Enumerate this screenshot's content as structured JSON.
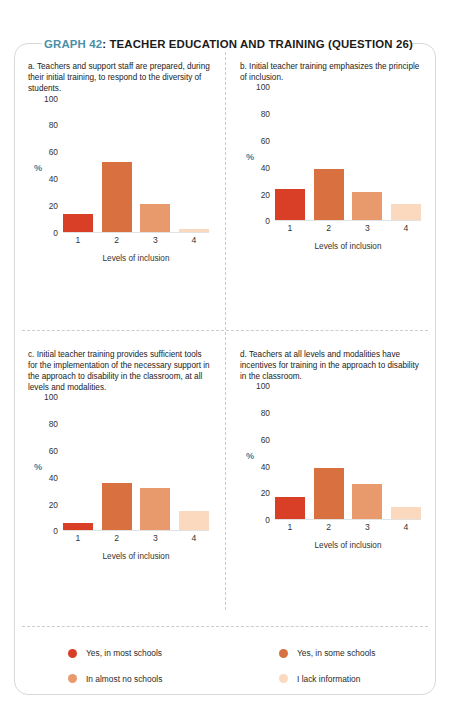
{
  "title": {
    "graph_number": "GRAPH 42",
    "separator": ": ",
    "text": "TEACHER EDUCATION AND TRAINING (QUESTION 26)",
    "accent_color": "#4a8fa8"
  },
  "axis": {
    "ylabel": "%",
    "xlabel": "Levels of inclusion",
    "yticks": [
      "0",
      "20",
      "40",
      "60",
      "80",
      "100"
    ],
    "xticks": [
      "1",
      "2",
      "3",
      "4"
    ],
    "ylim": [
      0,
      100
    ]
  },
  "colors": {
    "level1": "#d93f27",
    "level2": "#d9703f",
    "level3": "#e89a6d",
    "level4": "#fad9be",
    "divider": "#cccccc",
    "card_border": "#d8d8d8"
  },
  "legend": {
    "items": [
      {
        "label": "Yes, in most schools",
        "color": "#d93f27"
      },
      {
        "label": "Yes, in some schools",
        "color": "#d9703f"
      },
      {
        "label": "In almost no schools",
        "color": "#e89a6d"
      },
      {
        "label": "I lack information",
        "color": "#fad9be"
      }
    ]
  },
  "panels": [
    {
      "id": "a",
      "caption": "a. Teachers and support staff are prepared, during their initial training, to respond to the diversity of students."
    },
    {
      "id": "b",
      "caption": "b. Initial teacher training emphasizes the principle of inclusion."
    },
    {
      "id": "c",
      "caption": "c. Initial teacher training provides sufficient tools for the implementation of the necessary support in the approach to disability in the classroom, at all levels and modalities."
    },
    {
      "id": "d",
      "caption": "d. Teachers at all levels and modalities have incentives for training in the approach to disability in the classroom."
    }
  ],
  "chart_data": [
    {
      "type": "bar",
      "panel": "a",
      "title": "a. Teachers and support staff are prepared, during their initial training, to respond to the diversity of students.",
      "categories": [
        "1",
        "2",
        "3",
        "4"
      ],
      "values": [
        14,
        53,
        21,
        3
      ],
      "colors": [
        "#d93f27",
        "#d9703f",
        "#e89a6d",
        "#fad9be"
      ],
      "xlabel": "Levels of inclusion",
      "ylabel": "%",
      "ylim": [
        0,
        100
      ],
      "yticks": [
        0,
        20,
        40,
        60,
        80,
        100
      ],
      "grid": false,
      "legend_position": "bottom"
    },
    {
      "type": "bar",
      "panel": "b",
      "title": "b. Initial teacher training emphasizes the principle of inclusion.",
      "categories": [
        "1",
        "2",
        "3",
        "4"
      ],
      "values": [
        24,
        39,
        22,
        13
      ],
      "colors": [
        "#d93f27",
        "#d9703f",
        "#e89a6d",
        "#fad9be"
      ],
      "xlabel": "Levels of inclusion",
      "ylabel": "%",
      "ylim": [
        0,
        100
      ],
      "yticks": [
        0,
        20,
        40,
        60,
        80,
        100
      ],
      "grid": false,
      "legend_position": "bottom"
    },
    {
      "type": "bar",
      "panel": "c",
      "title": "c. Initial teacher training provides sufficient tools for the implementation of the necessary support in the approach to disability in the classroom, at all levels and modalities.",
      "categories": [
        "1",
        "2",
        "3",
        "4"
      ],
      "values": [
        6,
        36,
        32,
        15
      ],
      "colors": [
        "#d93f27",
        "#d9703f",
        "#e89a6d",
        "#fad9be"
      ],
      "xlabel": "Levels of inclusion",
      "ylabel": "%",
      "ylim": [
        0,
        100
      ],
      "yticks": [
        0,
        20,
        40,
        60,
        80,
        100
      ],
      "grid": false,
      "legend_position": "bottom"
    },
    {
      "type": "bar",
      "panel": "d",
      "title": "d. Teachers at all levels and modalities have incentives for training in the approach to disability in the classroom.",
      "categories": [
        "1",
        "2",
        "3",
        "4"
      ],
      "values": [
        17,
        39,
        27,
        10
      ],
      "colors": [
        "#d93f27",
        "#d9703f",
        "#e89a6d",
        "#fad9be"
      ],
      "xlabel": "Levels of inclusion",
      "ylabel": "%",
      "ylim": [
        0,
        100
      ],
      "yticks": [
        0,
        20,
        40,
        60,
        80,
        100
      ],
      "grid": false,
      "legend_position": "bottom"
    }
  ]
}
